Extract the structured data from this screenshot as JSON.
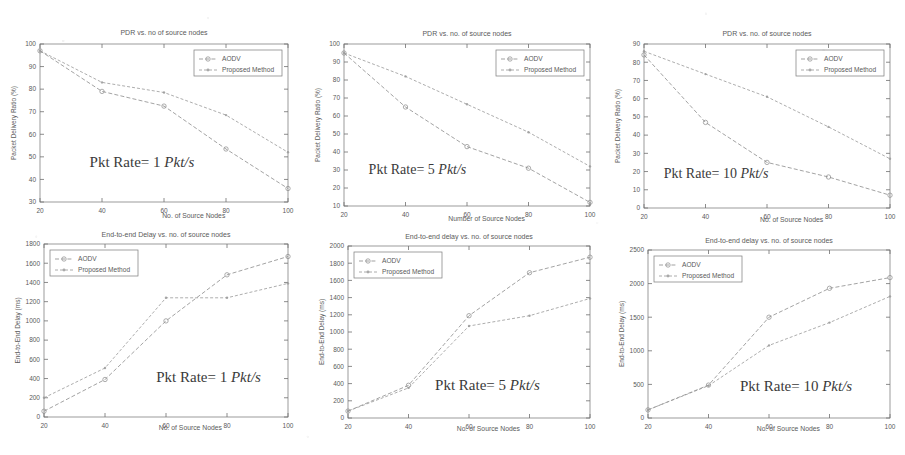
{
  "figure": {
    "panel_count": 6,
    "series_names": [
      "AODV",
      "Proposed Method"
    ],
    "colors": {
      "aodv": "#8d8d8d",
      "proposed": "#9a9a9a",
      "axis": "#6e6e6e",
      "text": "#5a5a5a"
    }
  },
  "panels": [
    {
      "id": "pdr-1pkts",
      "title": "PDR vs. no of source nodes",
      "xlabel": "No. of Source Nodes",
      "ylabel": "Packet Delivery Ratio (%)",
      "annotation_plain": "Pkt Rate= 1 ",
      "annotation_italic": "Pkt/s",
      "legend": [
        "AODV",
        "Proposed Method"
      ],
      "xticks": [
        "20",
        "40",
        "60",
        "80",
        "100"
      ],
      "yticks": [
        "30",
        "40",
        "50",
        "60",
        "70",
        "80",
        "90",
        "100"
      ]
    },
    {
      "id": "pdr-5pkts",
      "title": "PDR vs. no. of source nodes",
      "xlabel": "Number of Source Nodes",
      "ylabel": "Packet Delivery Ratio (%)",
      "annotation_plain": "Pkt Rate= 5 ",
      "annotation_italic": "Pkt/s",
      "legend": [
        "AODV",
        "Proposed Method"
      ],
      "xticks": [
        "20",
        "40",
        "60",
        "80",
        "100"
      ],
      "yticks": [
        "10",
        "20",
        "30",
        "40",
        "50",
        "60",
        "70",
        "80",
        "90",
        "100"
      ]
    },
    {
      "id": "pdr-10pkts",
      "title": "PDR vs. no. of source nodes",
      "xlabel": "No. of Source Nodes",
      "ylabel": "Packet Delivery Ratio (%)",
      "annotation_plain": "Pkt Rate= 10 ",
      "annotation_italic": "Pkt/s",
      "legend": [
        "AODV",
        "Proposed Method"
      ],
      "xticks": [
        "20",
        "40",
        "60",
        "80",
        "100"
      ],
      "yticks": [
        "0",
        "10",
        "20",
        "30",
        "40",
        "50",
        "60",
        "70",
        "80",
        "90"
      ]
    },
    {
      "id": "delay-1pkts",
      "title": "End-to-end Delay vs. no. of source nodes",
      "xlabel": "No. of Source Nodes",
      "ylabel": "End-to-End Delay (ms)",
      "annotation_plain": "Pkt Rate= 1 ",
      "annotation_italic": "Pkt/s",
      "legend": [
        "AODV",
        "Proposed Method"
      ],
      "xticks": [
        "20",
        "40",
        "60",
        "80",
        "100"
      ],
      "yticks": [
        "0",
        "200",
        "400",
        "600",
        "800",
        "1000",
        "1200",
        "1400",
        "1600",
        "1800"
      ]
    },
    {
      "id": "delay-5pkts",
      "title": "End-to-end delay vs. no. of source nodes",
      "xlabel": "No. of Source Nodes",
      "ylabel": "End-to-End Delay (ms)",
      "annotation_plain": "Pkt Rate= 5 ",
      "annotation_italic": "Pkt/s",
      "legend": [
        "AODV",
        "Proposed Method"
      ],
      "xticks": [
        "20",
        "40",
        "60",
        "80",
        "100"
      ],
      "yticks": [
        "0",
        "200",
        "400",
        "600",
        "800",
        "1000",
        "1200",
        "1400",
        "1600",
        "1800",
        "2000"
      ]
    },
    {
      "id": "delay-10pkts",
      "title": "End-to-end delay vs. no. of source nodes",
      "xlabel": "No. of Source Nodes",
      "ylabel": "End-to-End Delay (ms)",
      "annotation_plain": "Pkt Rate= 10 ",
      "annotation_italic": "Pkt/s",
      "legend": [
        "AODV",
        "Proposed Method"
      ],
      "xticks": [
        "20",
        "40",
        "60",
        "80",
        "100"
      ],
      "yticks": [
        "0",
        "500",
        "1000",
        "1500",
        "2000",
        "2500"
      ]
    }
  ],
  "chart_data": [
    {
      "panel": 0,
      "type": "line",
      "title": "PDR vs. no of source nodes",
      "xlabel": "No. of Source Nodes",
      "ylabel": "Packet Delivery Ratio (%)",
      "annotation": "Pkt Rate= 1 Pkt/s",
      "x": [
        20,
        40,
        60,
        80,
        100
      ],
      "xlim": [
        20,
        100
      ],
      "ylim": [
        30,
        100
      ],
      "grid": false,
      "legend_position": "top-right",
      "series": [
        {
          "name": "AODV",
          "values": [
            97,
            79,
            72.5,
            53.5,
            36
          ]
        },
        {
          "name": "Proposed Method",
          "values": [
            97,
            83,
            78.5,
            68.5,
            52
          ]
        }
      ]
    },
    {
      "panel": 1,
      "type": "line",
      "title": "PDR vs. no. of source nodes",
      "xlabel": "Number of Source Nodes",
      "ylabel": "Packet Delivery Ratio (%)",
      "annotation": "Pkt Rate= 5 Pkt/s",
      "x": [
        20,
        40,
        60,
        80,
        100
      ],
      "xlim": [
        20,
        100
      ],
      "ylim": [
        10,
        100
      ],
      "grid": false,
      "legend_position": "top-right",
      "series": [
        {
          "name": "AODV",
          "values": [
            95,
            65,
            43,
            31,
            12
          ]
        },
        {
          "name": "Proposed Method",
          "values": [
            95,
            82,
            66.5,
            51,
            32
          ]
        }
      ]
    },
    {
      "panel": 2,
      "type": "line",
      "title": "PDR vs. no. of source nodes",
      "xlabel": "No. of Source Nodes",
      "ylabel": "Packet Delivery Ratio (%)",
      "annotation": "Pkt Rate= 10 Pkt/s",
      "x": [
        20,
        40,
        60,
        80,
        100
      ],
      "xlim": [
        20,
        100
      ],
      "ylim": [
        0,
        90
      ],
      "grid": false,
      "legend_position": "top-right",
      "series": [
        {
          "name": "AODV",
          "values": [
            84,
            47,
            25,
            17,
            7
          ]
        },
        {
          "name": "Proposed Method",
          "values": [
            86,
            73.5,
            61,
            44.5,
            27
          ]
        }
      ]
    },
    {
      "panel": 3,
      "type": "line",
      "title": "End-to-end Delay vs. no. of source nodes",
      "xlabel": "No. of Source Nodes",
      "ylabel": "End-to-End Delay (ms)",
      "annotation": "Pkt Rate= 1 Pkt/s",
      "x": [
        20,
        40,
        60,
        80,
        100
      ],
      "xlim": [
        20,
        100
      ],
      "ylim": [
        0,
        1800
      ],
      "grid": false,
      "legend_position": "top-left",
      "series": [
        {
          "name": "AODV",
          "values": [
            60,
            390,
            1000,
            1480,
            1670
          ]
        },
        {
          "name": "Proposed Method",
          "values": [
            200,
            510,
            1240,
            1240,
            1390
          ]
        }
      ]
    },
    {
      "panel": 4,
      "type": "line",
      "title": "End-to-end delay vs. no. of source nodes",
      "xlabel": "No. of Source Nodes",
      "ylabel": "End-to-End Delay (ms)",
      "annotation": "Pkt Rate= 5 Pkt/s",
      "x": [
        20,
        40,
        60,
        80,
        100
      ],
      "xlim": [
        20,
        100
      ],
      "ylim": [
        0,
        2000
      ],
      "grid": false,
      "legend_position": "top-left",
      "series": [
        {
          "name": "AODV",
          "values": [
            80,
            380,
            1190,
            1690,
            1870
          ]
        },
        {
          "name": "Proposed Method",
          "values": [
            80,
            350,
            1070,
            1190,
            1390
          ]
        }
      ]
    },
    {
      "panel": 5,
      "type": "line",
      "title": "End-to-end delay vs. no. of source nodes",
      "xlabel": "No. of Source Nodes",
      "ylabel": "End-to-End Delay (ms)",
      "annotation": "Pkt Rate= 10 Pkt/s",
      "x": [
        20,
        40,
        60,
        80,
        100
      ],
      "xlim": [
        20,
        100
      ],
      "ylim": [
        0,
        2500
      ],
      "grid": false,
      "legend_position": "top-left",
      "series": [
        {
          "name": "AODV",
          "values": [
            120,
            490,
            1500,
            1930,
            2090
          ]
        },
        {
          "name": "Proposed Method",
          "values": [
            120,
            480,
            1080,
            1420,
            1810
          ]
        }
      ]
    }
  ]
}
